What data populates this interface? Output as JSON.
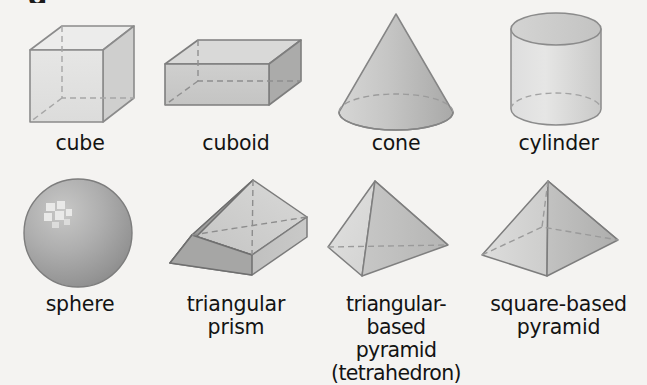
{
  "page": {
    "background_color": "#f4f3f1",
    "text_color": "#131313",
    "cropped_top_glyph": "g",
    "title": ""
  },
  "palette": {
    "outline": "#8b8b8b",
    "outline_dark": "#6e6e6e",
    "dashed": "#9a9a9a",
    "face_light": "#e3e3e2",
    "face_mid": "#cfcfcf",
    "face_mid_dark": "#bcbcbc",
    "face_dark": "#a8a8a8",
    "sphere_light": "#cdcdcd",
    "sphere_dark": "#8e8e8e",
    "highlight": "#efefef"
  },
  "shapes": [
    {
      "id": "cube",
      "label": "cube",
      "row": 1,
      "column": 1,
      "icon": "cube-figure",
      "description": "wireframe cube with dashed hidden edges"
    },
    {
      "id": "cuboid",
      "label": "cuboid",
      "row": 1,
      "column": 2,
      "icon": "cuboid-figure",
      "description": "rectangular box, grey faces, dashed hidden edges"
    },
    {
      "id": "cone",
      "label": "cone",
      "row": 1,
      "column": 3,
      "icon": "cone-figure",
      "description": "cone with dashed back base arc"
    },
    {
      "id": "cylinder",
      "label": "cylinder",
      "row": 1,
      "column": 4,
      "icon": "cylinder-figure",
      "description": "cylinder with elliptical top and dashed back base arc"
    },
    {
      "id": "sphere",
      "label": "sphere",
      "row": 2,
      "column": 1,
      "icon": "sphere-figure",
      "description": "shaded grey ball with upper-left specular highlight"
    },
    {
      "id": "triangular-prism",
      "label": "triangular\nprism",
      "row": 2,
      "column": 2,
      "icon": "triangular-prism-figure",
      "description": "tilted prism with dark left triangular face"
    },
    {
      "id": "triangular-based-pyramid",
      "label": "triangular-based\npyramid\n(tetrahedron)",
      "row": 2,
      "column": 3,
      "icon": "tetrahedron-figure",
      "description": "tetrahedron with dashed hidden back edge"
    },
    {
      "id": "square-based-pyramid",
      "label": "square-based\npyramid",
      "row": 2,
      "column": 4,
      "icon": "square-pyramid-figure",
      "description": "square pyramid with dashed hidden base edges"
    }
  ]
}
